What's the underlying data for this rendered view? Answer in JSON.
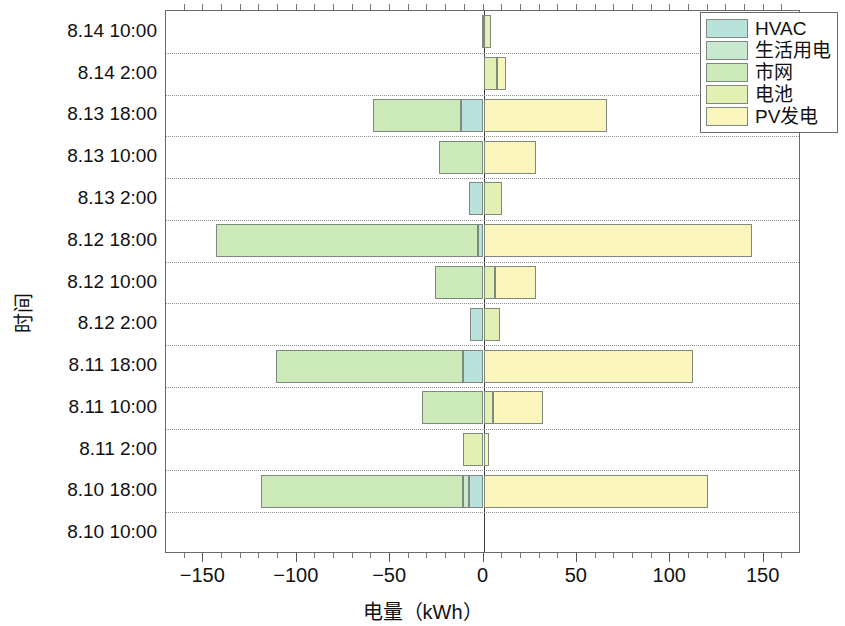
{
  "chart_data": {
    "type": "bar",
    "orientation": "horizontal",
    "stacked": true,
    "diverging": true,
    "title": "",
    "xlabel": "电量（kWh）",
    "ylabel": "时间",
    "xlim": [
      -170,
      170
    ],
    "xticks": [
      -150,
      -100,
      -50,
      0,
      50,
      100,
      150
    ],
    "xticklabels": [
      "−150",
      "−100",
      "−50",
      "0",
      "50",
      "100",
      "150"
    ],
    "xminor_step": 10,
    "grid": "y-dotted",
    "legend_position": "upper right",
    "categories": [
      "8.14 10:00",
      "8.14 2:00",
      "8.13 18:00",
      "8.13 10:00",
      "8.13 2:00",
      "8.12 18:00",
      "8.12 10:00",
      "8.12 2:00",
      "8.11 18:00",
      "8.11 10:00",
      "8.11 2:00",
      "8.10 18:00",
      "8.10 10:00"
    ],
    "series": [
      {
        "name": "HVAC",
        "color": "#b9e2db",
        "values": [
          0,
          0,
          -12,
          0,
          -8,
          -3,
          0,
          -7,
          -11,
          0,
          0,
          -8,
          0
        ]
      },
      {
        "name": "生活用电",
        "color": "#c8e8cf",
        "values": [
          0,
          0,
          0,
          0,
          0,
          0,
          0,
          0,
          0,
          0,
          0,
          -3,
          0
        ]
      },
      {
        "name": "市网",
        "color": "#cbe9b9",
        "values": [
          -1,
          0,
          -47,
          -24,
          0,
          -140,
          -26,
          0,
          -100,
          -33,
          0,
          -108,
          0
        ]
      },
      {
        "name": "电池",
        "color": "#e3f0b4",
        "values": [
          4,
          7,
          0,
          0,
          10,
          0,
          6,
          9,
          0,
          5,
          -11,
          0,
          0
        ]
      },
      {
        "name": "PV发电",
        "color": "#faf5bd",
        "values": [
          0,
          5,
          66,
          28,
          0,
          144,
          22,
          0,
          112,
          27,
          3,
          120,
          0
        ]
      }
    ],
    "legend_entries": [
      "HVAC",
      "生活用电",
      "市网",
      "电池",
      "PV发电"
    ]
  },
  "axis": {
    "x_title": "电量（kWh）",
    "y_title": "时间"
  }
}
